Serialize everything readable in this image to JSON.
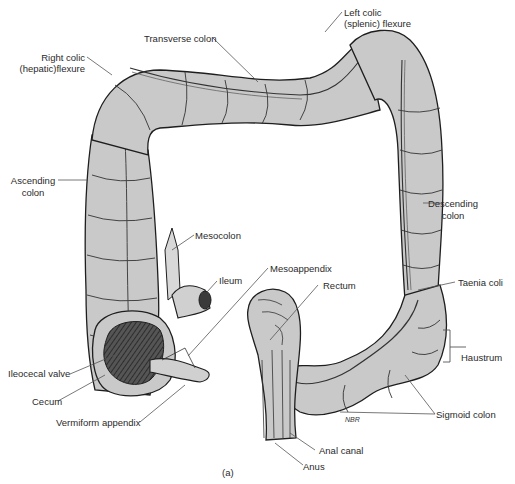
{
  "figure": {
    "panel_label": "(a)",
    "artist_signature": "NBR",
    "colors": {
      "tissue_fill": "#c9c9c9",
      "tissue_shadow": "#9a9a9a",
      "lumen_dark": "#3a3a3a",
      "outline": "#1e1e1e",
      "leader_line": "#555555",
      "background": "#ffffff"
    }
  },
  "labels": {
    "transverse_colon": "Transverse colon",
    "right_colic_flexure_1": "Right colic",
    "right_colic_flexure_2": "(hepatic)flexure",
    "left_colic_flexure_1": "Left colic",
    "left_colic_flexure_2": "(splenic) flexure",
    "ascending_colon_1": "Ascending",
    "ascending_colon_2": "colon",
    "descending_colon_1": "Descending",
    "descending_colon_2": "colon",
    "mesocolon": "Mesocolon",
    "ileum": "Ileum",
    "mesoappendix": "Mesoappendix",
    "rectum": "Rectum",
    "taenia_coli": "Taenia coli",
    "haustrum": "Haustrum",
    "ileocecal_valve": "Ileocecal valve",
    "cecum": "Cecum",
    "vermiform_appendix": "Vermiform appendix",
    "sigmoid_colon": "Sigmoid colon",
    "anal_canal": "Anal canal",
    "anus": "Anus"
  }
}
